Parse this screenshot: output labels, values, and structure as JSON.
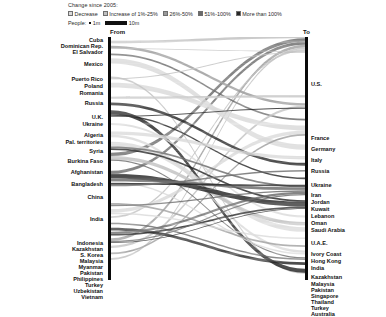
{
  "legend": {
    "title": "Change since 2005:",
    "items": [
      {
        "label": "Decrease",
        "color": "#d9d9d9",
        "icon": "legend-swatch"
      },
      {
        "label": "Increase of 1%-25%",
        "color": "#c0c0c0",
        "icon": "legend-swatch"
      },
      {
        "label": "26%-50%",
        "color": "#9a9a9a",
        "icon": "legend-swatch"
      },
      {
        "label": "51%-100%",
        "color": "#6a6a6a",
        "icon": "legend-swatch"
      },
      {
        "label": "More than 100%",
        "color": "#262626",
        "icon": "legend-swatch"
      }
    ],
    "scale": {
      "label": "People:",
      "small_label": "1m",
      "large_label": "10m",
      "small_icon": "thin-rule-icon",
      "large_icon": "thick-rule-icon"
    }
  },
  "axes": {
    "from_label": "From",
    "to_label": "To"
  },
  "chart_data": {
    "type": "sankey",
    "title": "Change since 2005:",
    "xlabel": "",
    "ylabel": "",
    "grid": false,
    "legend_position": "top",
    "axis_labels": {
      "left": "From",
      "right": "To"
    },
    "value_unit": "millions of people",
    "width_scale": {
      "1m": "thin rule",
      "10m": "thick rule"
    },
    "color_encoding": {
      "meaning": "Change since 2005",
      "bins": [
        "Decrease",
        "Increase of 1%-25%",
        "26%-50%",
        "51%-100%",
        "More than 100%"
      ],
      "colors": [
        "#d9d9d9",
        "#c0c0c0",
        "#9a9a9a",
        "#6a6a6a",
        "#262626"
      ]
    },
    "sources": [
      {
        "name": "Cuba",
        "y": 3,
        "value": 1.1,
        "bin": 1
      },
      {
        "name": "Dominican Rep.",
        "y": 9,
        "value": 1.0,
        "bin": 1
      },
      {
        "name": "El Salvador",
        "y": 15,
        "value": 1.3,
        "bin": 1
      },
      {
        "name": "Mexico",
        "y": 27,
        "value": 12.2,
        "bin": 0
      },
      {
        "name": "Puerto Rico",
        "y": 42,
        "value": 1.7,
        "bin": 1
      },
      {
        "name": "Poland",
        "y": 49,
        "value": 4.4,
        "bin": 2
      },
      {
        "name": "Romania",
        "y": 56,
        "value": 3.4,
        "bin": 3
      },
      {
        "name": "Russia",
        "y": 66,
        "value": 10.6,
        "bin": 0
      },
      {
        "name": "U.K.",
        "y": 80,
        "value": 4.9,
        "bin": 1
      },
      {
        "name": "Ukraine",
        "y": 87,
        "value": 5.8,
        "bin": 0
      },
      {
        "name": "Algeria",
        "y": 98,
        "value": 1.8,
        "bin": 1
      },
      {
        "name": "Pal. territories",
        "y": 105,
        "value": 3.6,
        "bin": 2
      },
      {
        "name": "Syria",
        "y": 114,
        "value": 5.1,
        "bin": 4
      },
      {
        "name": "Burkina Faso",
        "y": 124,
        "value": 1.5,
        "bin": 1
      },
      {
        "name": "Afghanistan",
        "y": 135,
        "value": 4.8,
        "bin": 2
      },
      {
        "name": "Bangladesh",
        "y": 147,
        "value": 7.2,
        "bin": 2
      },
      {
        "name": "China",
        "y": 160,
        "value": 10.0,
        "bin": 3
      },
      {
        "name": "India",
        "y": 182,
        "value": 15.6,
        "bin": 3
      },
      {
        "name": "Indonesia",
        "y": 206,
        "value": 4.2,
        "bin": 2
      },
      {
        "name": "Kazakhstan",
        "y": 212,
        "value": 4.1,
        "bin": 0
      },
      {
        "name": "S. Korea",
        "y": 218,
        "value": 2.3,
        "bin": 1
      },
      {
        "name": "Malaysia",
        "y": 224,
        "value": 1.7,
        "bin": 2
      },
      {
        "name": "Myanmar",
        "y": 230,
        "value": 3.0,
        "bin": 1
      },
      {
        "name": "Pakistan",
        "y": 236,
        "value": 6.0,
        "bin": 2
      },
      {
        "name": "Philippines",
        "y": 242,
        "value": 5.3,
        "bin": 2
      },
      {
        "name": "Turkey",
        "y": 248,
        "value": 3.1,
        "bin": 1
      },
      {
        "name": "Uzbekistan",
        "y": 254,
        "value": 2.0,
        "bin": 2
      },
      {
        "name": "Vietnam",
        "y": 260,
        "value": 2.6,
        "bin": 1
      }
    ],
    "targets": [
      {
        "name": "U.S.",
        "y": 47,
        "value": 46.6,
        "bin": 1
      },
      {
        "name": "France",
        "y": 101,
        "value": 7.8,
        "bin": 1
      },
      {
        "name": "Germany",
        "y": 112,
        "value": 12.0,
        "bin": 2
      },
      {
        "name": "Italy",
        "y": 123,
        "value": 5.8,
        "bin": 3
      },
      {
        "name": "Russia",
        "y": 134,
        "value": 11.6,
        "bin": 0
      },
      {
        "name": "Ukraine",
        "y": 148,
        "value": 4.8,
        "bin": 0
      },
      {
        "name": "Iran",
        "y": 158,
        "value": 2.7,
        "bin": 0
      },
      {
        "name": "Jordan",
        "y": 165,
        "value": 3.1,
        "bin": 4
      },
      {
        "name": "Kuwait",
        "y": 172,
        "value": 2.9,
        "bin": 3
      },
      {
        "name": "Lebanon",
        "y": 179,
        "value": 2.0,
        "bin": 4
      },
      {
        "name": "Oman",
        "y": 186,
        "value": 1.8,
        "bin": 4
      },
      {
        "name": "Saudi Arabia",
        "y": 193,
        "value": 10.2,
        "bin": 3
      },
      {
        "name": "U.A.E.",
        "y": 206,
        "value": 8.1,
        "bin": 4
      },
      {
        "name": "Ivory Coast",
        "y": 217,
        "value": 2.2,
        "bin": 0
      },
      {
        "name": "Hong Kong",
        "y": 224,
        "value": 2.8,
        "bin": 1
      },
      {
        "name": "India",
        "y": 231,
        "value": 5.2,
        "bin": 0
      },
      {
        "name": "Kazakhstan",
        "y": 240,
        "value": 3.5,
        "bin": 0
      },
      {
        "name": "Malaysia",
        "y": 247,
        "value": 2.5,
        "bin": 2
      },
      {
        "name": "Pakistan",
        "y": 253,
        "value": 3.6,
        "bin": 0
      },
      {
        "name": "Singapore",
        "y": 259,
        "value": 2.5,
        "bin": 3
      },
      {
        "name": "Thailand",
        "y": 265,
        "value": 3.9,
        "bin": 4
      },
      {
        "name": "Turkey",
        "y": 271,
        "value": 3.0,
        "bin": 2
      },
      {
        "name": "Australia",
        "y": 277,
        "value": 6.8,
        "bin": 2
      }
    ],
    "flows": [
      {
        "source": "Mexico",
        "target": "U.S.",
        "value": 12.2,
        "bin": 0
      },
      {
        "source": "Cuba",
        "target": "U.S.",
        "value": 1.1,
        "bin": 1
      },
      {
        "source": "Dominican Rep.",
        "target": "U.S.",
        "value": 1.0,
        "bin": 1
      },
      {
        "source": "El Salvador",
        "target": "U.S.",
        "value": 1.3,
        "bin": 1
      },
      {
        "source": "Puerto Rico",
        "target": "U.S.",
        "value": 1.7,
        "bin": 1
      },
      {
        "source": "China",
        "target": "U.S.",
        "value": 2.3,
        "bin": 3
      },
      {
        "source": "India",
        "target": "U.S.",
        "value": 2.1,
        "bin": 3
      },
      {
        "source": "Philippines",
        "target": "U.S.",
        "value": 1.9,
        "bin": 2
      },
      {
        "source": "Vietnam",
        "target": "U.S.",
        "value": 1.3,
        "bin": 1
      },
      {
        "source": "S. Korea",
        "target": "U.S.",
        "value": 1.1,
        "bin": 1
      },
      {
        "source": "Poland",
        "target": "Germany",
        "value": 1.6,
        "bin": 2
      },
      {
        "source": "Poland",
        "target": "U.S.",
        "value": 0.5,
        "bin": 1
      },
      {
        "source": "Romania",
        "target": "Italy",
        "value": 1.1,
        "bin": 3
      },
      {
        "source": "Turkey",
        "target": "Germany",
        "value": 1.5,
        "bin": 1
      },
      {
        "source": "Russia",
        "target": "Ukraine",
        "value": 3.6,
        "bin": 0
      },
      {
        "source": "Ukraine",
        "target": "Russia",
        "value": 3.3,
        "bin": 0
      },
      {
        "source": "Kazakhstan",
        "target": "Russia",
        "value": 2.5,
        "bin": 0
      },
      {
        "source": "Uzbekistan",
        "target": "Russia",
        "value": 1.2,
        "bin": 2
      },
      {
        "source": "U.K.",
        "target": "Australia",
        "value": 1.2,
        "bin": 1
      },
      {
        "source": "U.K.",
        "target": "U.S.",
        "value": 0.7,
        "bin": 1
      },
      {
        "source": "Algeria",
        "target": "France",
        "value": 1.5,
        "bin": 1
      },
      {
        "source": "Pal. territories",
        "target": "Jordan",
        "value": 2.0,
        "bin": 4
      },
      {
        "source": "Syria",
        "target": "Turkey",
        "value": 2.7,
        "bin": 4
      },
      {
        "source": "Syria",
        "target": "Lebanon",
        "value": 1.1,
        "bin": 4
      },
      {
        "source": "Syria",
        "target": "Germany",
        "value": 0.6,
        "bin": 4
      },
      {
        "source": "Burkina Faso",
        "target": "Ivory Coast",
        "value": 1.4,
        "bin": 0
      },
      {
        "source": "Afghanistan",
        "target": "Iran",
        "value": 2.3,
        "bin": 0
      },
      {
        "source": "Afghanistan",
        "target": "Pakistan",
        "value": 1.7,
        "bin": 0
      },
      {
        "source": "Bangladesh",
        "target": "India",
        "value": 3.2,
        "bin": 0
      },
      {
        "source": "Bangladesh",
        "target": "Saudi Arabia",
        "value": 1.3,
        "bin": 3
      },
      {
        "source": "Bangladesh",
        "target": "U.A.E.",
        "value": 1.1,
        "bin": 4
      },
      {
        "source": "China",
        "target": "Hong Kong",
        "value": 2.3,
        "bin": 1
      },
      {
        "source": "China",
        "target": "Singapore",
        "value": 0.9,
        "bin": 3
      },
      {
        "source": "India",
        "target": "U.A.E.",
        "value": 3.3,
        "bin": 4
      },
      {
        "source": "India",
        "target": "Saudi Arabia",
        "value": 2.0,
        "bin": 3
      },
      {
        "source": "India",
        "target": "Pakistan",
        "value": 1.1,
        "bin": 0
      },
      {
        "source": "India",
        "target": "Oman",
        "value": 1.2,
        "bin": 4
      },
      {
        "source": "India",
        "target": "Kuwait",
        "value": 1.1,
        "bin": 3
      },
      {
        "source": "Indonesia",
        "target": "Malaysia",
        "value": 1.2,
        "bin": 2
      },
      {
        "source": "Indonesia",
        "target": "Saudi Arabia",
        "value": 1.0,
        "bin": 3
      },
      {
        "source": "Kazakhstan",
        "target": "Kazakhstan",
        "value": 1.1,
        "bin": 0
      },
      {
        "source": "Malaysia",
        "target": "Singapore",
        "value": 1.1,
        "bin": 3
      },
      {
        "source": "Myanmar",
        "target": "Thailand",
        "value": 1.9,
        "bin": 4
      },
      {
        "source": "Pakistan",
        "target": "Saudi Arabia",
        "value": 1.5,
        "bin": 3
      },
      {
        "source": "Pakistan",
        "target": "U.A.E.",
        "value": 1.2,
        "bin": 4
      },
      {
        "source": "Philippines",
        "target": "Saudi Arabia",
        "value": 0.9,
        "bin": 3
      },
      {
        "source": "Philippines",
        "target": "U.A.E.",
        "value": 0.6,
        "bin": 4
      }
    ]
  }
}
